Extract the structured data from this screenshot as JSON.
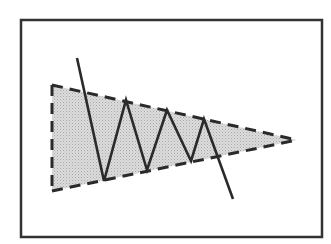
{
  "diagram": {
    "colors": {
      "frame": "#333333",
      "line": "#2a2a2a",
      "fill": "#cfcfcf",
      "background": "#ffffff"
    },
    "frame": {
      "x": 21,
      "y": 20,
      "width": 301,
      "height": 217
    },
    "triangle": {
      "points": [
        [
          52,
          85
        ],
        [
          297,
          140
        ],
        [
          52,
          191
        ]
      ],
      "upper_trendline": [
        [
          52,
          85
        ],
        [
          297,
          140
        ]
      ],
      "lower_trendline": [
        [
          52,
          191
        ],
        [
          297,
          140
        ]
      ],
      "left_edge": [
        [
          52,
          85
        ],
        [
          52,
          191
        ]
      ]
    },
    "price_path": [
      [
        77,
        58
      ],
      [
        104,
        181
      ],
      [
        126,
        100
      ],
      [
        147,
        170
      ],
      [
        167,
        110
      ],
      [
        191,
        161
      ],
      [
        204,
        119
      ],
      [
        233,
        199
      ]
    ]
  }
}
